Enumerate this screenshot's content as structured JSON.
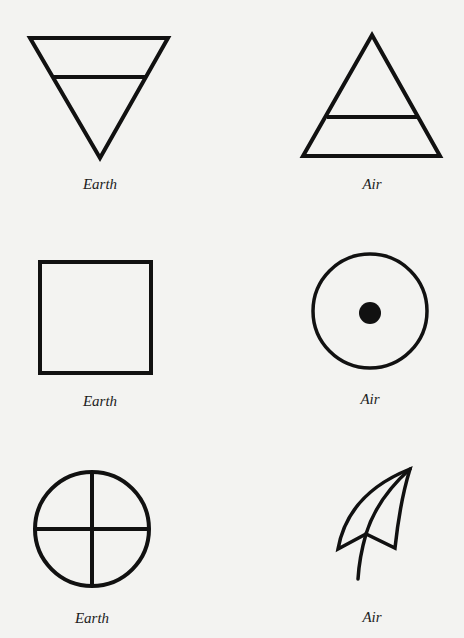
{
  "colors": {
    "background": "#f3f3f1",
    "ink": "#111111"
  },
  "symbols": [
    {
      "name": "earth-inverted-triangle",
      "label": "Earth",
      "label_x": 100,
      "label_y": 176
    },
    {
      "name": "air-triangle",
      "label": "Air",
      "label_x": 372,
      "label_y": 176
    },
    {
      "name": "earth-square",
      "label": "Earth",
      "label_x": 100,
      "label_y": 393
    },
    {
      "name": "air-circle-dot",
      "label": "Air",
      "label_x": 370,
      "label_y": 391
    },
    {
      "name": "earth-circle-cross",
      "label": "Earth",
      "label_x": 92,
      "label_y": 610
    },
    {
      "name": "air-leaf",
      "label": "Air",
      "label_x": 372,
      "label_y": 609
    }
  ]
}
